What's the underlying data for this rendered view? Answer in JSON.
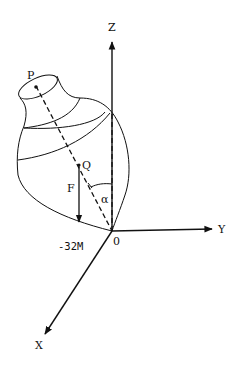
{
  "figure": {
    "type": "physics-diagram",
    "labels": {
      "z_axis": "Z",
      "y_axis": "Y",
      "x_axis": "X",
      "origin": "0",
      "point_p": "P",
      "point_q": "Q",
      "force": "F",
      "weight": "-32M",
      "angle": "α"
    },
    "colors": {
      "background": "#ffffff",
      "ink": "#111111"
    }
  }
}
